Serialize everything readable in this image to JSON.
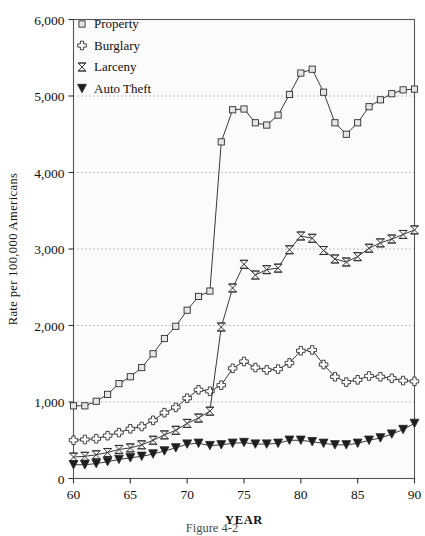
{
  "chart_data": {
    "type": "line",
    "title": "",
    "xlabel": "YEAR",
    "ylabel": "Rate per 100,000 Americans",
    "xlim": [
      60,
      90
    ],
    "ylim": [
      0,
      6000
    ],
    "xticks": [
      60,
      65,
      70,
      75,
      80,
      85,
      90
    ],
    "xtick_labels": [
      "60",
      "65",
      "70",
      "75",
      "80",
      "85",
      "90"
    ],
    "yticks": [
      0,
      1000,
      2000,
      3000,
      4000,
      5000,
      6000
    ],
    "ytick_labels": [
      "0",
      "1,000",
      "2,000",
      "3,000",
      "4,000",
      "5,000",
      "6,000"
    ],
    "grid": "horizontal-dotted",
    "legend_position": "top-left",
    "x": [
      60,
      61,
      62,
      63,
      64,
      65,
      66,
      67,
      68,
      69,
      70,
      71,
      72,
      73,
      74,
      75,
      76,
      77,
      78,
      79,
      80,
      81,
      82,
      83,
      84,
      85,
      86,
      87,
      88,
      89,
      90
    ],
    "series": [
      {
        "name": "Property",
        "marker": "square",
        "values": [
          950,
          950,
          1010,
          1100,
          1240,
          1330,
          1450,
          1630,
          1830,
          1990,
          2200,
          2380,
          2450,
          4400,
          4820,
          4830,
          4650,
          4620,
          4750,
          5020,
          5300,
          5350,
          5050,
          4650,
          4500,
          4650,
          4860,
          4950,
          5030,
          5080,
          5090
        ]
      },
      {
        "name": "Burglary",
        "marker": "cross-diamond",
        "values": [
          500,
          510,
          520,
          560,
          600,
          650,
          680,
          760,
          860,
          930,
          1050,
          1160,
          1140,
          1220,
          1440,
          1530,
          1450,
          1420,
          1430,
          1510,
          1670,
          1680,
          1490,
          1330,
          1260,
          1290,
          1340,
          1330,
          1310,
          1280,
          1270
        ]
      },
      {
        "name": "Larceny",
        "marker": "bowtie",
        "values": [
          280,
          290,
          310,
          340,
          380,
          400,
          440,
          500,
          570,
          630,
          720,
          790,
          880,
          1980,
          2490,
          2800,
          2660,
          2730,
          2750,
          2990,
          3170,
          3140,
          2980,
          2870,
          2830,
          2900,
          3010,
          3080,
          3130,
          3190,
          3250
        ]
      },
      {
        "name": "Auto Theft",
        "marker": "triangle-down",
        "values": [
          180,
          180,
          195,
          220,
          250,
          270,
          290,
          320,
          360,
          400,
          450,
          460,
          430,
          440,
          460,
          470,
          450,
          450,
          460,
          500,
          500,
          480,
          460,
          440,
          440,
          460,
          500,
          530,
          580,
          640,
          720
        ]
      }
    ]
  },
  "legend": {
    "items": [
      {
        "label": "Property",
        "marker": "square"
      },
      {
        "label": "Burglary",
        "marker": "cross-diamond"
      },
      {
        "label": "Larceny",
        "marker": "bowtie"
      },
      {
        "label": "Auto Theft",
        "marker": "triangle-down"
      }
    ]
  },
  "caption": {
    "text": "Figure 4-2"
  },
  "colors": {
    "line": "#3a3a3a",
    "grid": "#7a7a7a",
    "frame": "#555555",
    "text": "#111111",
    "plot_background": "#fbfbfb"
  }
}
